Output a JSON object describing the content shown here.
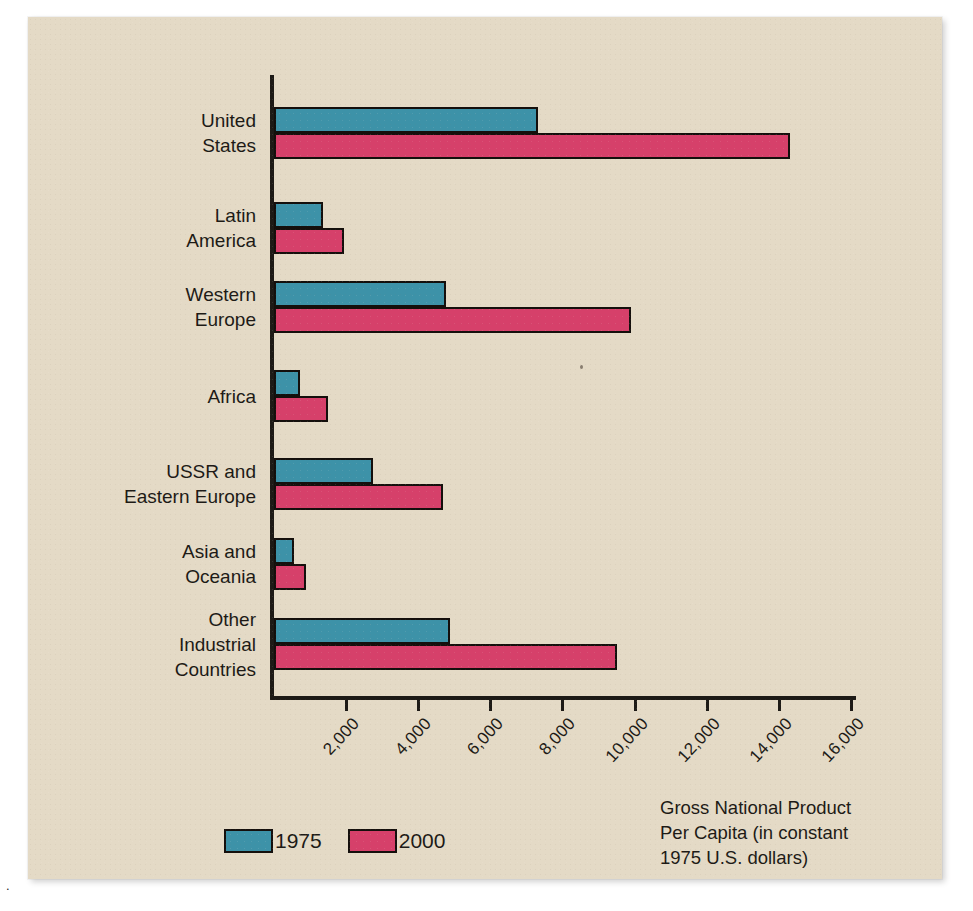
{
  "figure": {
    "page_mark": ".",
    "background_color": "#e4dac6",
    "caption": "Gross National Product\nPer Capita (in constant\n1975 U.S. dollars)"
  },
  "legend": {
    "position": "bottom-left",
    "items": [
      {
        "label": "1975",
        "color": "#3d92a8"
      },
      {
        "label": "2000",
        "color": "#d6406a"
      }
    ]
  },
  "axis": {
    "tick_labels": [
      "2,000",
      "4,000",
      "6,000",
      "8,000",
      "10,000",
      "12,000",
      "14,000",
      "16,000"
    ],
    "tick_values": [
      2000,
      4000,
      6000,
      8000,
      10000,
      12000,
      14000,
      16000
    ],
    "max": 16000,
    "rotation_degrees": -47
  },
  "chart_data": {
    "type": "bar",
    "orientation": "horizontal",
    "title": "",
    "subtitle": "",
    "xlabel": "Gross National Product Per Capita (in constant 1975 U.S. dollars)",
    "ylabel": "",
    "xlim": [
      0,
      16000
    ],
    "grid": false,
    "legend_position": "bottom-left",
    "categories": [
      "United\nStates",
      "Latin\nAmerica",
      "Western\nEurope",
      "Africa",
      "USSR and\nEastern Europe",
      "Asia and\nOceania",
      "Other\nIndustrial\nCountries"
    ],
    "category_labels_flat": [
      "United States",
      "Latin America",
      "Western Europe",
      "Africa",
      "USSR and Eastern Europe",
      "Asia and Oceania",
      "Other Industrial Countries"
    ],
    "series": [
      {
        "name": "1975",
        "color": "#3d92a8",
        "values": [
          7200,
          1250,
          4670,
          600,
          2640,
          440,
          4780
        ]
      },
      {
        "name": "2000",
        "color": "#d6406a",
        "values": [
          14200,
          1830,
          9800,
          1390,
          4580,
          790,
          9400
        ]
      }
    ]
  }
}
